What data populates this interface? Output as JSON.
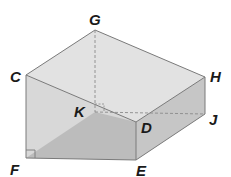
{
  "diagram": {
    "type": "triangular-prism",
    "vertices": {
      "C": {
        "label": "C",
        "x": 26,
        "y": 75
      },
      "F": {
        "label": "F",
        "x": 26,
        "y": 158
      },
      "E": {
        "label": "E",
        "x": 136,
        "y": 160
      },
      "D": {
        "label": "D",
        "x": 136,
        "y": 122
      },
      "G": {
        "label": "G",
        "x": 95,
        "y": 30
      },
      "H": {
        "label": "H",
        "x": 205,
        "y": 77
      },
      "J": {
        "label": "J",
        "x": 205,
        "y": 114
      },
      "K": {
        "label": "K",
        "x": 95,
        "y": 112
      }
    },
    "labels": [
      "G",
      "C",
      "H",
      "K",
      "D",
      "J",
      "F",
      "E"
    ],
    "colors": {
      "top_face": "#e2e2e2",
      "left_face": "#d6d6d6",
      "bottom_face": "#bdbdbd",
      "right_face": "#c4c4c4",
      "edge": "#7a7a7a",
      "hidden_edge": "#8a8a8a"
    }
  }
}
